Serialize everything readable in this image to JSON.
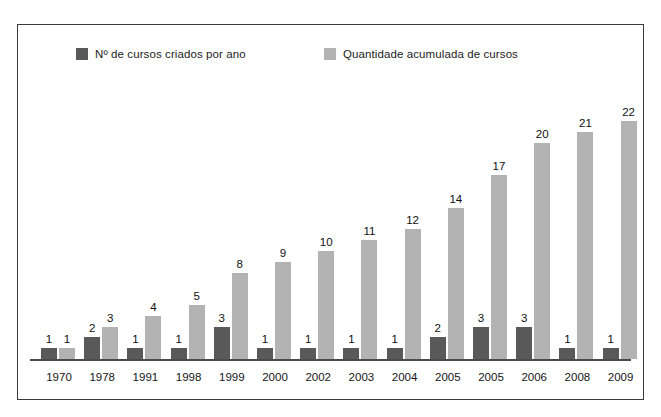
{
  "chart_data": {
    "type": "bar",
    "title": "",
    "subtitle": "",
    "xlabel": "",
    "ylabel": "",
    "grid": false,
    "legend_position": "top",
    "ylim": [
      0,
      22
    ],
    "categories": [
      "1970",
      "1978",
      "1991",
      "1998",
      "1999",
      "2000",
      "2002",
      "2003",
      "2004",
      "2005",
      "2005",
      "2006",
      "2008",
      "2009"
    ],
    "series": [
      {
        "name": "Nº de cursos criados por ano",
        "color": "#595959",
        "values": [
          1,
          2,
          1,
          1,
          3,
          1,
          1,
          1,
          1,
          2,
          3,
          3,
          1,
          1
        ]
      },
      {
        "name": "Quantidade acumulada de cursos",
        "color": "#b3b3b3",
        "values": [
          1,
          3,
          4,
          5,
          8,
          9,
          10,
          11,
          12,
          14,
          17,
          20,
          21,
          22
        ]
      }
    ]
  },
  "legend": {
    "items": [
      {
        "label": "Nº de cursos criados por ano",
        "color": "#595959"
      },
      {
        "label": "Quantidade acumulada de cursos",
        "color": "#b3b3b3"
      }
    ]
  },
  "frame": {
    "border_color": "#3a3a3a",
    "background": "#ffffff"
  },
  "axis": {
    "line_color": "#4a4a4a"
  }
}
